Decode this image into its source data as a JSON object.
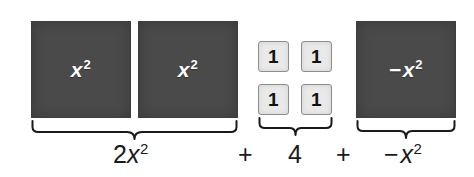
{
  "figure": {
    "kind": "algebra-tiles-model",
    "colors": {
      "xsq_tile": "#4a4a4a",
      "unit_tile": "#e9e9e9",
      "unit_tile_border": "#8d8d8d",
      "text_dark": "#1a1a1a",
      "text_light": "#ffffff",
      "background": "#ffffff"
    },
    "groups": [
      {
        "id": "group-x-squared",
        "tile_count": 2,
        "tile_type": "x-squared",
        "tile_label_base": "x",
        "tile_label_exponent": "2",
        "tile_label_sign": "",
        "summary": "2x",
        "summary_exponent": "2"
      },
      {
        "id": "group-units",
        "tile_count": 4,
        "tile_type": "unit",
        "tile_label_base": "1",
        "tile_label_exponent": "",
        "tile_label_sign": "",
        "summary": "4",
        "summary_exponent": ""
      },
      {
        "id": "group-negative-x-squared",
        "tile_count": 1,
        "tile_type": "negative-x-squared",
        "tile_label_base": "x",
        "tile_label_exponent": "2",
        "tile_label_sign": "−",
        "summary": "x",
        "summary_exponent": "2",
        "summary_sign": "−"
      }
    ],
    "tiles": {
      "xsq_1_label_base": "x",
      "xsq_1_label_exp": "2",
      "xsq_2_label_base": "x",
      "xsq_2_label_exp": "2",
      "unit_1_label": "1",
      "unit_2_label": "1",
      "unit_3_label": "1",
      "unit_4_label": "1",
      "negxsq_label_sign": "−",
      "negxsq_label_base": "x",
      "negxsq_label_exp": "2"
    },
    "expression": {
      "term1_coefficient": "2",
      "term1_base": "x",
      "term1_exponent": "2",
      "operator1": "+",
      "term2": "4",
      "operator2": "+",
      "term3_sign": "−",
      "term3_base": "x",
      "term3_exponent": "2",
      "full_text": "2x² + 4 + −x²"
    }
  }
}
